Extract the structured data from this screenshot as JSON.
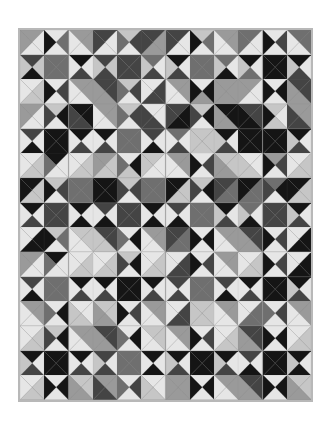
{
  "image": {
    "title": "",
    "description": "Grayscale quilt made of hourglass (quarter-square triangle) and half-square triangle blocks",
    "grid": {
      "columns": 12,
      "rows": 15
    },
    "palette": {
      "K": "#151515",
      "D": "#444444",
      "M": "#6f6f6f",
      "G": "#9a9a9a",
      "L": "#c6c6c6",
      "W": "#e6e6e6"
    },
    "border_color": "#b8b8b8",
    "background_color": "#ffffff",
    "block_encoding": "Each block = top,right,bottom,left triangle colors (palette keys)",
    "rows": [
      [
        "GWWG",
        "WMWK",
        "GGWW",
        "DWWD",
        "LDWM",
        "DGGD",
        "DWWD",
        "LMWK",
        "GGWW",
        "MWWM",
        "WDWK",
        "MMWW"
      ],
      [
        "DLKL",
        "MMMM",
        "KWDW",
        "DLDL",
        "DDDD",
        "MWDL",
        "KWDL",
        "MMMM",
        "MWKL",
        "KWML",
        "KKKK",
        "KWDL"
      ],
      [
        "WLLW",
        "WDWK",
        "GGWW",
        "DDGG",
        "LDWM",
        "WDDW",
        "GGWW",
        "WKGK",
        "GGGG",
        "GWWG",
        "WKWK",
        "DDGG"
      ],
      [
        "GWWG",
        "LKWD",
        "KKDD",
        "GGWW",
        "LDWM",
        "WWDD",
        "DKKD",
        "LKWD",
        "KKGG",
        "DDKK",
        "LWLK",
        "GGDD"
      ],
      [
        "DWKW",
        "KKKK",
        "KWDW",
        "KWDW",
        "MMMM",
        "DWKW",
        "MWDW",
        "LLLL",
        "KWDL",
        "KKKK",
        "KKKK",
        "KWDL"
      ],
      [
        "WLLW",
        "KWWM",
        "WLLW",
        "GLLG",
        "WKLM",
        "LWWL",
        "GGWW",
        "WDWK",
        "LLGG",
        "WWLL",
        "GDWK",
        "WLLW"
      ],
      [
        "KLLK",
        "LDWK",
        "MMMM",
        "KKKK",
        "LDWD",
        "MMMM",
        "KLLK",
        "LKWD",
        "DMMD",
        "KMMK",
        "MKWD",
        "KLLK"
      ],
      [
        "KWDW",
        "DDDD",
        "KWKW",
        "DWKW",
        "DDDD",
        "KWKW",
        "DWKW",
        "MMMM",
        "KWDL",
        "MWKL",
        "DDDD",
        "KWDL"
      ],
      [
        "WKKW",
        "LMWK",
        "LLWW",
        "DDLL",
        "WKWM",
        "GGWW",
        "DMMD",
        "WKWK",
        "GGWW",
        "DDGG",
        "WDWK",
        "WKKW"
      ],
      [
        "GWWG",
        "KWWM",
        "WLLW",
        "WLLW",
        "LKWD",
        "WLLW",
        "WDDW",
        "WDWK",
        "GGWW",
        "WLLW",
        "WDWK",
        "WKKW"
      ],
      [
        "DWKW",
        "MMMM",
        "KWDW",
        "KWDW",
        "KKKK",
        "KWDW",
        "DWDW",
        "MMMM",
        "DWKW",
        "KWDW",
        "KKKK",
        "KWDL"
      ],
      [
        "GGWW",
        "WKWM",
        "WWLL",
        "LLGG",
        "WDWK",
        "GGWW",
        "WDDW",
        "LLLL",
        "GGWW",
        "WMMW",
        "WDWM",
        "GGWW"
      ],
      [
        "WLLW",
        "LKWD",
        "GGWW",
        "DDGG",
        "WKWM",
        "LLWW",
        "GGWW",
        "WDWK",
        "WLLW",
        "DDGG",
        "WKWK",
        "WLLW"
      ],
      [
        "KWDL",
        "KKKK",
        "KWDW",
        "DWDL",
        "MMMM",
        "KWKW",
        "KWDL",
        "KKKK",
        "KWDL",
        "DWKW",
        "KKKK",
        "KWKL"
      ],
      [
        "WLLW",
        "WKWK",
        "LLGG",
        "GGDD",
        "WDWM",
        "WWLL",
        "GGGG",
        "WKWK",
        "GGWW",
        "DDGG",
        "WKWK",
        "LLGG"
      ]
    ]
  }
}
